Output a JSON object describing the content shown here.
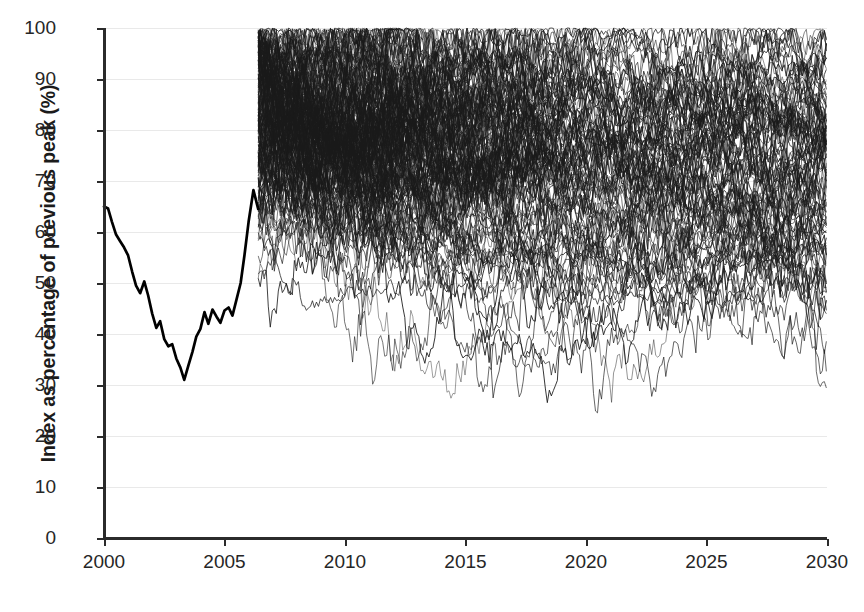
{
  "chart_data": {
    "type": "line",
    "title": "",
    "subtitle": "",
    "xlabel": "",
    "ylabel": "Index as percentage of previous peak (%)",
    "xlim": [
      2000,
      2030
    ],
    "ylim": [
      0,
      100
    ],
    "grid": true,
    "legend": null,
    "legend_position": "none",
    "x_ticks": [
      2000,
      2005,
      2010,
      2015,
      2020,
      2025,
      2030
    ],
    "x_tick_labels": [
      "2000",
      "2005",
      "2010",
      "2015",
      "2020",
      "2025",
      "2030"
    ],
    "y_ticks": [
      0,
      10,
      20,
      30,
      40,
      50,
      60,
      70,
      80,
      90,
      100
    ],
    "y_tick_labels": [
      "0",
      "10",
      "20",
      "30",
      "40",
      "50",
      "60",
      "70",
      "80",
      "90",
      "100"
    ],
    "annotations": [],
    "series": [
      {
        "name": "historical-index",
        "kind": "history",
        "style": "thick-black-line",
        "color": "#000000",
        "x_start": 2000.0,
        "x_end": 2006.4,
        "sample_step_years": 0.0833,
        "x": [
          2000.0,
          2000.17,
          2000.33,
          2000.5,
          2000.67,
          2000.83,
          2001.0,
          2001.17,
          2001.33,
          2001.5,
          2001.67,
          2001.83,
          2002.0,
          2002.17,
          2002.33,
          2002.5,
          2002.67,
          2002.83,
          2003.0,
          2003.17,
          2003.33,
          2003.5,
          2003.67,
          2003.83,
          2004.0,
          2004.17,
          2004.33,
          2004.5,
          2004.67,
          2004.83,
          2005.0,
          2005.17,
          2005.33,
          2005.5,
          2005.67,
          2005.83,
          2006.0,
          2006.2,
          2006.4
        ],
        "values": [
          65.0,
          64.6,
          62.0,
          59.5,
          58.2,
          57.0,
          55.4,
          52.2,
          49.5,
          48.0,
          50.3,
          47.6,
          44.0,
          41.2,
          42.5,
          39.0,
          37.6,
          38.0,
          35.2,
          33.4,
          31.0,
          33.8,
          36.5,
          39.5,
          41.0,
          44.3,
          42.0,
          44.8,
          43.4,
          42.2,
          44.6,
          45.2,
          43.6,
          46.8,
          50.0,
          55.5,
          62.0,
          68.2,
          64.5
        ]
      },
      {
        "name": "monte-carlo-simulations",
        "kind": "simulation-fan",
        "style": "thin-black-spaghetti",
        "color": "#1a1a1a",
        "path_count": 110,
        "x_start": 2006.4,
        "x_end": 2030.0,
        "sample_step_years": 0.0833,
        "start_value_range": [
          44,
          100
        ],
        "clip_max": 100,
        "observed_min": 23,
        "observed_max": 100,
        "description": "Fan of simulated index paths, densest (near solid black) 2006-2010 and progressively thinning toward 2030; upper paths clipped at the 100% ceiling, lowest excursions reaching roughly 23-24%."
      }
    ]
  },
  "colors": {
    "axis": "#2b2b2b",
    "grid": "#e9e9e9",
    "history_line": "#000000",
    "simulation_line": "#1a1a1a",
    "background": "#ffffff",
    "text": "#262626"
  }
}
